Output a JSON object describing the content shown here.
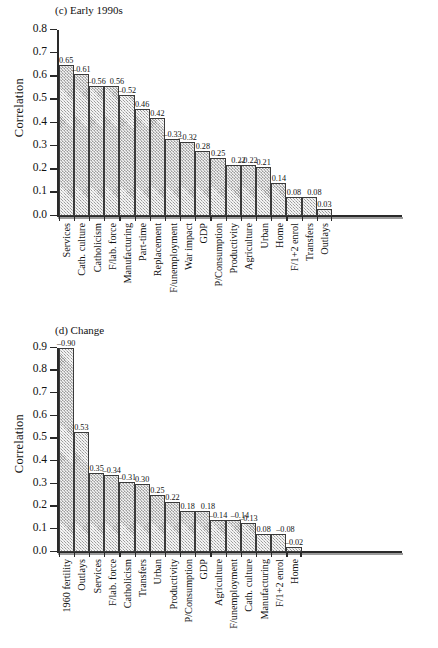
{
  "chart_data": [
    {
      "type": "bar",
      "panel_id": "c",
      "title": "(c) Early 1990s",
      "xlabel": "",
      "ylabel": "Correlation",
      "ylim": [
        0.0,
        0.8
      ],
      "yticks": [
        "0.0",
        "0.1",
        "0.2",
        "0.3",
        "0.4",
        "0.5",
        "0.6",
        "0.7",
        "0.8"
      ],
      "grid": false,
      "legend": "none",
      "categories": [
        "Services",
        "Cath. culture",
        "Catholicism",
        "F/lab. force",
        "Manufacturing",
        "Part-time",
        "Replacement",
        "F/unemployment",
        "War impact",
        "GDP",
        "P/Consumption",
        "Productivity",
        "Agriculture",
        "Urban",
        "Home",
        "F/1+2 enrol",
        "Transfers",
        "Outlays"
      ],
      "values": [
        0.65,
        0.61,
        0.56,
        0.56,
        0.52,
        0.46,
        0.42,
        0.33,
        0.32,
        0.28,
        0.25,
        0.22,
        0.22,
        0.21,
        0.14,
        0.08,
        0.08,
        0.03
      ],
      "data_labels": [
        "0.65",
        "–0.61",
        "–0.56",
        "0.56",
        "–0.52",
        "0.46",
        "0.42",
        "–0.33",
        "–0.32",
        "0.28",
        "0.25",
        "0.22",
        "–0.22",
        "0.21",
        "0.14",
        "0.08",
        "0.08",
        "0.03"
      ]
    },
    {
      "type": "bar",
      "panel_id": "d",
      "title": "(d) Change",
      "xlabel": "",
      "ylabel": "Correlation",
      "ylim": [
        0.0,
        0.9
      ],
      "yticks": [
        "0.0",
        "0.1",
        "0.2",
        "0.3",
        "0.4",
        "0.5",
        "0.6",
        "0.7",
        "0.8",
        "0.9"
      ],
      "grid": false,
      "legend": "none",
      "categories": [
        "1960 fertility",
        "Outlays",
        "Services",
        "F/lab. force",
        "Catholicism",
        "Transfers",
        "Urban",
        "Productivity",
        "P/Consumption",
        "GDP",
        "Agriculture",
        "F/unemployment",
        "Cath. culture",
        "Manufacturing",
        "F/1+2 enrol",
        "Home"
      ],
      "values": [
        0.9,
        0.53,
        0.35,
        0.34,
        0.31,
        0.3,
        0.25,
        0.22,
        0.18,
        0.18,
        0.14,
        0.14,
        0.13,
        0.08,
        0.08,
        0.02
      ],
      "data_labels": [
        "–0.90",
        "0.53",
        "0.35",
        "–0.34",
        "–0.31",
        "0.30",
        "0.25",
        "0.22",
        "0.18",
        "0.18",
        "–0.14",
        "–0.14",
        "–0.13",
        "0.08",
        "–0.08",
        "–0.02"
      ]
    }
  ],
  "style": {
    "bar_fill": "#c9c9c9",
    "bar_edge": "#3a3a3a",
    "axis_color": "#2a2a2a",
    "text_color": "#111111"
  }
}
